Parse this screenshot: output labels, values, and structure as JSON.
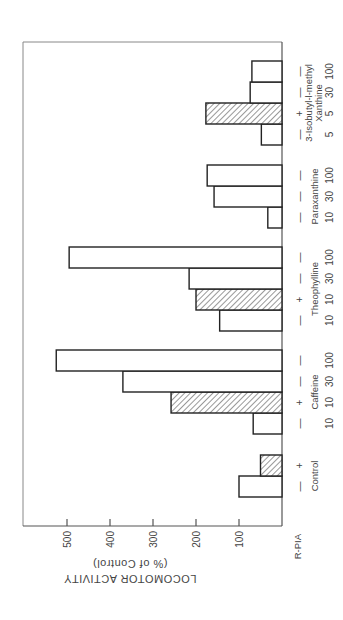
{
  "chart_data": {
    "type": "bar",
    "orientation": "horizontal (figure rotated 90°)",
    "title": "",
    "ylabel": "LOCOMOTOR ACTIVITY",
    "ylabel_sub": "(% of Control)",
    "xlabel": "",
    "ylim": [
      0,
      550
    ],
    "yticks": [
      100,
      200,
      300,
      400,
      500
    ],
    "row_header": "R-PIA",
    "legend": {
      "open": "R-PIA absent (−)",
      "hatched": "R-PIA present (+)"
    },
    "groups": [
      {
        "name": "Control",
        "bars": [
          {
            "rpia": "—",
            "dose": "",
            "value": 100,
            "hatched": false
          },
          {
            "rpia": "+",
            "dose": "",
            "value": 50,
            "hatched": true
          }
        ]
      },
      {
        "name": "Caffeine",
        "bars": [
          {
            "rpia": "—",
            "dose": "10",
            "value": 67,
            "hatched": false
          },
          {
            "rpia": "+",
            "dose": "10",
            "value": 258,
            "hatched": true
          },
          {
            "rpia": "—",
            "dose": "30",
            "value": 370,
            "hatched": false
          },
          {
            "rpia": "—",
            "dose": "100",
            "value": 525,
            "hatched": false
          }
        ]
      },
      {
        "name": "Theophylline",
        "bars": [
          {
            "rpia": "—",
            "dose": "10",
            "value": 145,
            "hatched": false
          },
          {
            "rpia": "+",
            "dose": "10",
            "value": 200,
            "hatched": true
          },
          {
            "rpia": "—",
            "dose": "30",
            "value": 216,
            "hatched": false
          },
          {
            "rpia": "—",
            "dose": "100",
            "value": 495,
            "hatched": false
          }
        ]
      },
      {
        "name": "Paraxanthine",
        "bars": [
          {
            "rpia": "—",
            "dose": "10",
            "value": 33,
            "hatched": false
          },
          {
            "rpia": "—",
            "dose": "30",
            "value": 158,
            "hatched": false
          },
          {
            "rpia": "—",
            "dose": "100",
            "value": 174,
            "hatched": false
          }
        ]
      },
      {
        "name": "3-Isobutyl-l-methyl Xanthine",
        "name_lines": [
          "3-Isobutyl-l-methyl",
          "Xanthine"
        ],
        "bars": [
          {
            "rpia": "—",
            "dose": "5",
            "value": 48,
            "hatched": false
          },
          {
            "rpia": "+",
            "dose": "5",
            "value": 177,
            "hatched": true
          },
          {
            "rpia": "—",
            "dose": "30",
            "value": 74,
            "hatched": false
          },
          {
            "rpia": "—",
            "dose": "100",
            "value": 70,
            "hatched": false
          }
        ]
      }
    ]
  }
}
